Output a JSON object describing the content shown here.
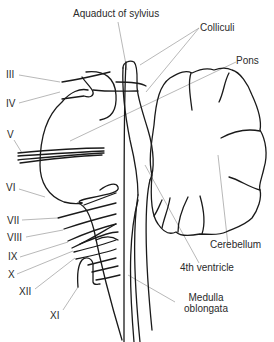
{
  "diagram": {
    "colors": {
      "ink": "#1a1a1a",
      "leader": "#9a9a9a",
      "text": "#2a2a2a",
      "background": "#ffffff"
    },
    "labels": {
      "aquaduct": "Aquaduct of sylvius",
      "colliculi": "Colliculi",
      "pons": "Pons",
      "cerebellum": "Cerebellum",
      "fourth_ventricle": "4th ventricle",
      "medulla_line1": "Medulla",
      "medulla_line2": "oblongata"
    },
    "cranial_nerves": [
      {
        "id": "III",
        "label": "III"
      },
      {
        "id": "IV",
        "label": "IV"
      },
      {
        "id": "V",
        "label": "V"
      },
      {
        "id": "VI",
        "label": "VI"
      },
      {
        "id": "VII",
        "label": "VII"
      },
      {
        "id": "VIII",
        "label": "VIII"
      },
      {
        "id": "IX",
        "label": "IX"
      },
      {
        "id": "X",
        "label": "X"
      },
      {
        "id": "XII",
        "label": "XII"
      },
      {
        "id": "XI",
        "label": "XI"
      }
    ]
  }
}
